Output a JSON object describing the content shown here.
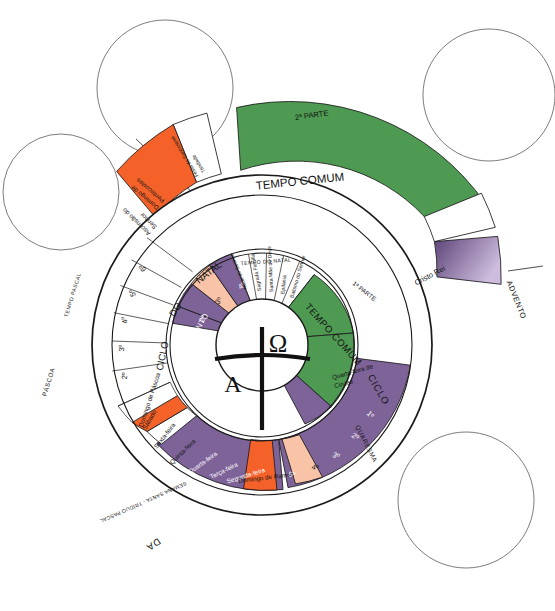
{
  "meta": {
    "colors": {
      "green": "#4f9a52",
      "purple": "#7e6399",
      "purple_dark": "#6f5a8c",
      "orange": "#f4622a",
      "pink": "#f9c3a8",
      "white": "#ffffff",
      "outline": "#1a1a1a",
      "callout_stroke": "#6d6d6d"
    }
  },
  "callouts": [
    {
      "name": "callout-top-left",
      "cx": 61,
      "cy": 192,
      "r": 58
    },
    {
      "name": "callout-top-center",
      "cx": 165,
      "cy": 88,
      "r": 68
    },
    {
      "name": "callout-top-right",
      "cx": 489,
      "cy": 95,
      "r": 66
    },
    {
      "name": "callout-bottom-right",
      "cx": 466,
      "cy": 500,
      "r": 68
    }
  ],
  "annotations": {
    "parte2": "2ª PARTE",
    "parte1": "1ª PARTE"
  },
  "outer_ring": {
    "name": "outer-ring",
    "segments": [
      {
        "label": "TEMPO COMUM",
        "color": "green",
        "text_color": "#141414",
        "start": -97,
        "end": 22,
        "size": "xbig"
      },
      {
        "label": "Cristo Rei",
        "color": "white",
        "text_color": "#141414",
        "start": 22,
        "end": 35,
        "size": "med"
      },
      {
        "label": "ADVENTO",
        "color": "purple",
        "text_color": "#141414",
        "start": 35,
        "end": 60,
        "size": "med"
      },
      {
        "label": "Festa da Santíssima Trindade",
        "color": "white",
        "text_color": "#141414",
        "start": -112,
        "end": -99,
        "size": "tiny"
      },
      {
        "label": "Domingo de Pentecostes",
        "color": "orange",
        "text_color": "#141414",
        "start": -137,
        "end": -114,
        "size": "small"
      }
    ]
  },
  "middle_ring": {
    "name": "middle-ring-tempo-pascal",
    "cycle_label": "CICLO DA PÁSCOA",
    "pascal_label": "TEMPO PASCAL",
    "pascoa_label": "PÁSCOA",
    "semana_santa_label": "SEMANA SANTA - TRÍDUO PASCAL",
    "segments": [
      {
        "label": "Ascensão do Senhor",
        "color": "white",
        "size": "small"
      },
      {
        "label": "6º",
        "color": "white",
        "size": "num"
      },
      {
        "label": "5º",
        "color": "white",
        "size": "num"
      },
      {
        "label": "4º",
        "color": "white",
        "size": "num"
      },
      {
        "label": "3º",
        "color": "white",
        "size": "num"
      },
      {
        "label": "2º",
        "color": "white",
        "size": "num"
      },
      {
        "label": "Domingo de Páscoa",
        "color": "white",
        "size": "small"
      },
      {
        "label": "Sábado",
        "color": "white",
        "size": "small"
      },
      {
        "label": "Sexta-feira",
        "color": "orange",
        "size": "small"
      },
      {
        "label": "Quinta-feira",
        "color": "white",
        "size": "small"
      },
      {
        "label": "Quarta-feira",
        "color": "purple",
        "size": "small"
      },
      {
        "label": "Terça-feira",
        "color": "purple",
        "size": "small"
      },
      {
        "label": "Segunda-feira",
        "color": "purple",
        "size": "small"
      },
      {
        "label": "Domingo de Ramos",
        "color": "orange",
        "size": "small"
      },
      {
        "label": "5º",
        "color": "purple",
        "size": "num"
      },
      {
        "label": "4º",
        "color": "pink",
        "size": "num"
      },
      {
        "label": "3º",
        "color": "purple",
        "size": "num"
      },
      {
        "label": "2º",
        "color": "purple",
        "size": "num"
      },
      {
        "label": "1º",
        "color": "purple",
        "size": "num"
      },
      {
        "label": "Quarta-feira de Cinzas",
        "color": "purple",
        "size": "small"
      }
    ],
    "quaresma_label": "QUARESMA",
    "ciclo_label": "CICLO"
  },
  "inner_ring": {
    "name": "inner-ring",
    "natal_cycle_label": "CICLO DO NATAL",
    "advento_label": "ADVENTO",
    "tempo_natal_label": "TEMPO DO NATAL",
    "tempo_comum_label": "TEMPO COMUM",
    "advento_weeks": [
      {
        "label": "4º",
        "color": "purple"
      },
      {
        "label": "3º",
        "color": "pink"
      },
      {
        "label": "2º",
        "color": "purple"
      },
      {
        "label": "1º",
        "color": "purple"
      }
    ],
    "natal_feasts": [
      {
        "label": "Natal do Senhor",
        "color": "white"
      },
      {
        "label": "Sagrada Família",
        "color": "white"
      },
      {
        "label": "Santa Mãe de Deus",
        "color": "white"
      },
      {
        "label": "Epifania",
        "color": "white"
      },
      {
        "label": "Batismo do Senhor",
        "color": "white"
      }
    ]
  },
  "center": {
    "name": "center-christ-symbol",
    "alpha": "A",
    "omega": "Ω"
  }
}
